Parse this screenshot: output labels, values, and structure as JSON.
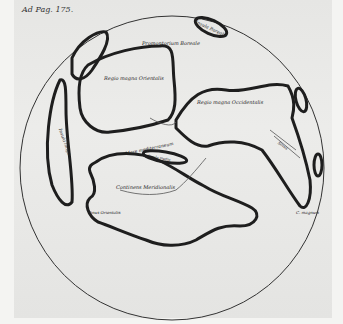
{
  "page_ref": "Ad Pag. 175.",
  "map": {
    "type": "globe-engraving",
    "labels": {
      "insula_borealis": "Insula Borealis",
      "promontorium": "Promontorium Boreale",
      "regio_orientalis": "Regio magna Orientalis",
      "regio_occidentalis": "Regio magna Occidentalis",
      "insula_longa": "Insula longa",
      "mare_medit": "Mare mediterraneum",
      "insula_media": "Insula media",
      "continens": "Continens Meridionalis",
      "sinus_orientalis": "Sinus Orientalis",
      "sinus_occ": "Sinus",
      "c_magnum": "C. magnum"
    },
    "colors": {
      "ink": "#1e1e1e",
      "paper": "#e8e8e6"
    }
  }
}
